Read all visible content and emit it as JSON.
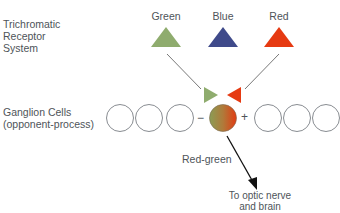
{
  "system_label": [
    "Trichromatic",
    "Receptor",
    "System"
  ],
  "receptors": [
    {
      "name": "Green",
      "color": "#8fac6e"
    },
    {
      "name": "Blue",
      "color": "#3f4a8a"
    },
    {
      "name": "Red",
      "color": "#e63a12"
    }
  ],
  "ganglion_label": [
    "Ganglion Cells",
    "(opponent-process)"
  ],
  "opponent": {
    "minus_sign": "−",
    "plus_sign": "+",
    "inhibit_color": "#8fac6e",
    "excite_color": "#e63a12",
    "cell_label": "Red-green"
  },
  "output_label": [
    "To optic nerve",
    "and brain"
  ]
}
